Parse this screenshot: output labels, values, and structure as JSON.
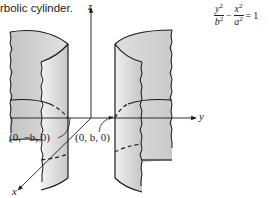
{
  "figure": {
    "caption": "rbolic cylinder.",
    "equation": {
      "term1_num": "y",
      "term1_den": "b",
      "term2_num": "x",
      "term2_den": "a",
      "exp": "2",
      "minus": "−",
      "equals": "=",
      "rhs": "1"
    },
    "axes": {
      "x": "x",
      "y": "y",
      "z": "z"
    },
    "points": {
      "left_vertex": "(0, −b, 0)",
      "right_vertex": "(0, b, 0)"
    },
    "colors": {
      "surface_light": "#ececec",
      "surface_mid": "#d4d4d4",
      "surface_dark": "#bdbdbd",
      "line": "#1a1a1a"
    }
  }
}
